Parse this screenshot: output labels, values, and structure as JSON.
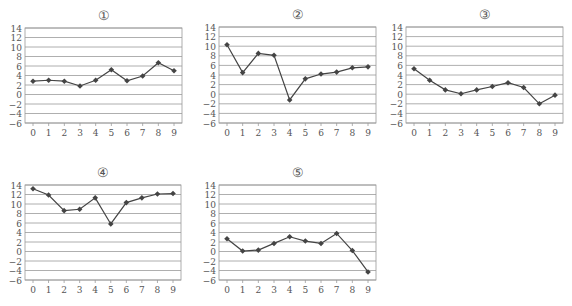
{
  "chart_data": [
    {
      "type": "line",
      "title": "①",
      "x": [
        0,
        1,
        2,
        3,
        4,
        5,
        6,
        7,
        8,
        9
      ],
      "values": [
        2.8,
        3.0,
        2.8,
        1.8,
        3.0,
        5.2,
        2.9,
        3.9,
        6.7,
        5.0
      ],
      "yticks": [
        14,
        12,
        10,
        8,
        6,
        4,
        2,
        0,
        -2,
        -4,
        -6
      ],
      "ylim": [
        -6,
        14
      ],
      "grid": true,
      "xlabel": "",
      "ylabel": ""
    },
    {
      "type": "line",
      "title": "②",
      "x": [
        0,
        1,
        2,
        3,
        4,
        5,
        6,
        7,
        8,
        9
      ],
      "values": [
        10.3,
        4.5,
        8.5,
        8.1,
        -1.2,
        3.2,
        4.2,
        4.6,
        5.5,
        5.7
      ],
      "yticks": [
        14,
        12,
        10,
        8,
        6,
        4,
        2,
        0,
        -2,
        -4,
        -6
      ],
      "ylim": [
        -6,
        14
      ],
      "grid": true,
      "xlabel": "",
      "ylabel": ""
    },
    {
      "type": "line",
      "title": "③",
      "x": [
        0,
        1,
        2,
        3,
        4,
        5,
        6,
        7,
        8,
        9
      ],
      "values": [
        5.3,
        2.9,
        0.9,
        0.1,
        0.9,
        1.6,
        2.4,
        1.4,
        -2.0,
        -0.2
      ],
      "yticks": [
        14,
        12,
        10,
        8,
        6,
        4,
        2,
        0,
        -2,
        -4,
        -6
      ],
      "ylim": [
        -6,
        14
      ],
      "grid": true,
      "xlabel": "",
      "ylabel": ""
    },
    {
      "type": "line",
      "title": "④",
      "x": [
        0,
        1,
        2,
        3,
        4,
        5,
        6,
        7,
        8,
        9
      ],
      "values": [
        13.2,
        11.9,
        8.6,
        8.9,
        11.3,
        5.8,
        10.3,
        11.3,
        12.1,
        12.2
      ],
      "yticks": [
        14,
        12,
        10,
        8,
        6,
        4,
        2,
        0,
        -2,
        -4,
        -6
      ],
      "ylim": [
        -6,
        14
      ],
      "grid": true,
      "xlabel": "",
      "ylabel": ""
    },
    {
      "type": "line",
      "title": "⑤",
      "x": [
        0,
        1,
        2,
        3,
        4,
        5,
        6,
        7,
        8,
        9
      ],
      "values": [
        2.7,
        0.1,
        0.3,
        1.7,
        3.1,
        2.2,
        1.7,
        3.8,
        0.2,
        -4.3
      ],
      "yticks": [
        14,
        12,
        10,
        8,
        6,
        4,
        2,
        0,
        -2,
        -4,
        -6
      ],
      "ylim": [
        -6,
        14
      ],
      "grid": true,
      "xlabel": "",
      "ylabel": ""
    }
  ],
  "layout": [
    {
      "left": 25,
      "top": 28,
      "right": 182,
      "bottom": 123
    },
    {
      "left": 219,
      "top": 27,
      "right": 376,
      "bottom": 123
    },
    {
      "left": 406,
      "top": 27,
      "right": 563,
      "bottom": 123
    },
    {
      "left": 25,
      "top": 185,
      "right": 181,
      "bottom": 280
    },
    {
      "left": 219,
      "top": 185,
      "right": 376,
      "bottom": 280
    }
  ],
  "style": {
    "line_color": "#444444",
    "grid_color": "#9a9a9a",
    "text_color": "#555555"
  }
}
